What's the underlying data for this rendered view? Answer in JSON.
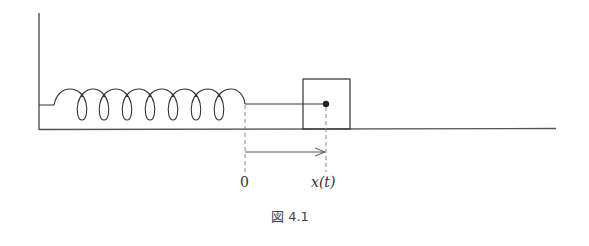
{
  "figure": {
    "caption": "図 4.1",
    "labels": {
      "origin": "0",
      "position": "x(t)"
    },
    "elements": [
      "wall",
      "floor",
      "spring",
      "mass-block",
      "center-dot",
      "displacement-arrow",
      "dashed-guides"
    ],
    "colors": {
      "line": "#333333",
      "dashed": "#888888"
    }
  }
}
